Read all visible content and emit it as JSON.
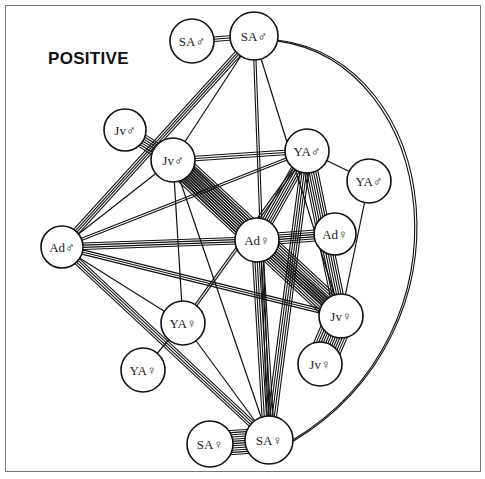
{
  "title": "POSITIVE",
  "colors": {
    "stroke": "#111111",
    "background": "#ffffff",
    "frame": "#777777"
  },
  "nodes": [
    {
      "id": "sa_m1",
      "label": "SA♂",
      "x": 192,
      "y": 41,
      "r": 22
    },
    {
      "id": "sa_m2",
      "label": "SA♂",
      "x": 254,
      "y": 36,
      "r": 24
    },
    {
      "id": "jv_m1",
      "label": "Jv♂",
      "x": 125,
      "y": 130,
      "r": 21
    },
    {
      "id": "jv_m2",
      "label": "Jv♂",
      "x": 173,
      "y": 160,
      "r": 22
    },
    {
      "id": "ya_m1",
      "label": "YA♂",
      "x": 307,
      "y": 151,
      "r": 22
    },
    {
      "id": "ya_m2",
      "label": "YA♂",
      "x": 369,
      "y": 181,
      "r": 22
    },
    {
      "id": "ad_m",
      "label": "Ad♂",
      "x": 62,
      "y": 247,
      "r": 21
    },
    {
      "id": "ad_f1",
      "label": "Ad♀",
      "x": 257,
      "y": 240,
      "r": 22
    },
    {
      "id": "ad_f2",
      "label": "Ad♀",
      "x": 335,
      "y": 234,
      "r": 21
    },
    {
      "id": "jv_f1",
      "label": "Jv♀",
      "x": 341,
      "y": 316,
      "r": 22
    },
    {
      "id": "jv_f2",
      "label": "Jv♀",
      "x": 320,
      "y": 364,
      "r": 22
    },
    {
      "id": "ya_f1",
      "label": "YA♀",
      "x": 183,
      "y": 323,
      "r": 22
    },
    {
      "id": "ya_f2",
      "label": "YA♀",
      "x": 143,
      "y": 370,
      "r": 22
    },
    {
      "id": "sa_f1",
      "label": "SA♀",
      "x": 210,
      "y": 444,
      "r": 23
    },
    {
      "id": "sa_f2",
      "label": "SA♀",
      "x": 269,
      "y": 440,
      "r": 24
    }
  ],
  "edges": [
    {
      "from": "sa_m1",
      "to": "sa_m2",
      "lines": 3
    },
    {
      "from": "sa_m2",
      "to": "ad_m",
      "lines": 4
    },
    {
      "from": "sa_m2",
      "to": "jv_m2",
      "lines": 1
    },
    {
      "from": "sa_m2",
      "to": "sa_f2",
      "lines": 2
    },
    {
      "from": "sa_m2",
      "to": "jv_f1",
      "lines": 1
    },
    {
      "from": "jv_m1",
      "to": "jv_m2",
      "lines": 7
    },
    {
      "from": "jv_m2",
      "to": "ya_m1",
      "lines": 3
    },
    {
      "from": "jv_m2",
      "to": "ad_f1",
      "lines": 9
    },
    {
      "from": "jv_m2",
      "to": "jv_f1",
      "lines": 12
    },
    {
      "from": "jv_m2",
      "to": "ad_m",
      "lines": 1
    },
    {
      "from": "jv_m2",
      "to": "ya_f1",
      "lines": 1
    },
    {
      "from": "jv_m2",
      "to": "sa_f2",
      "lines": 1
    },
    {
      "from": "ya_m1",
      "to": "ya_m2",
      "lines": 1
    },
    {
      "from": "ya_m1",
      "to": "ad_f1",
      "lines": 6
    },
    {
      "from": "ya_m1",
      "to": "jv_f1",
      "lines": 7
    },
    {
      "from": "ya_m1",
      "to": "sa_f2",
      "lines": 5
    },
    {
      "from": "ya_m1",
      "to": "ad_m",
      "lines": 2
    },
    {
      "from": "ya_m1",
      "to": "ya_f1",
      "lines": 2
    },
    {
      "from": "ya_m2",
      "to": "jv_f1",
      "lines": 1
    },
    {
      "from": "ad_m",
      "to": "ad_f1",
      "lines": 4
    },
    {
      "from": "ad_m",
      "to": "jv_f1",
      "lines": 3
    },
    {
      "from": "ad_m",
      "to": "ya_f1",
      "lines": 1
    },
    {
      "from": "ad_m",
      "to": "sa_f2",
      "lines": 4
    },
    {
      "from": "ad_f1",
      "to": "ad_f2",
      "lines": 6
    },
    {
      "from": "ad_f1",
      "to": "jv_f1",
      "lines": 5
    },
    {
      "from": "ad_f1",
      "to": "sa_f2",
      "lines": 6
    },
    {
      "from": "jv_f1",
      "to": "jv_f2",
      "lines": 14
    },
    {
      "from": "ya_f1",
      "to": "ya_f2",
      "lines": 1
    },
    {
      "from": "ya_f1",
      "to": "sa_f2",
      "lines": 1
    },
    {
      "from": "sa_f1",
      "to": "sa_f2",
      "lines": 12
    }
  ],
  "arc": {
    "from": "sa_m2",
    "to": "sa_f2",
    "lines": 2,
    "style": "large-arc-right"
  }
}
